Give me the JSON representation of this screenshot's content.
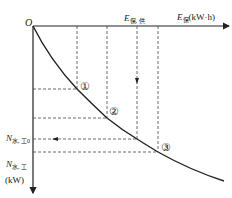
{
  "diagram": {
    "origin_label": "O",
    "x_axis": {
      "symbol": "E",
      "subscript": "保",
      "unit": "(kW·h)"
    },
    "x_marker": {
      "symbol": "E",
      "subscript": "保, 供"
    },
    "y_axis": {
      "symbol": "N",
      "superscript": "″",
      "subscript": "水, 工",
      "unit": "(kW)"
    },
    "y_marker": {
      "symbol": "N",
      "superscript": "″",
      "subscript": "水, 工0"
    },
    "points": [
      {
        "label": "①",
        "x": 77,
        "y": 89
      },
      {
        "label": "②",
        "x": 107,
        "y": 118
      },
      {
        "label": "③",
        "x": 158,
        "y": 152
      }
    ],
    "intersection": {
      "x": 137,
      "y": 139
    },
    "colors": {
      "line": "#222222",
      "background": "#ffffff"
    }
  }
}
